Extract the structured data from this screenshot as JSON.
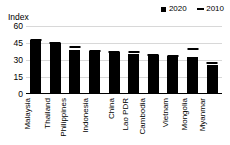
{
  "chart_data": {
    "type": "bar",
    "title": "",
    "subtitle": "",
    "xlabel": "",
    "ylabel": "Index",
    "ylim": [
      0,
      60
    ],
    "yticks": [
      0,
      15,
      30,
      45,
      60
    ],
    "grid": true,
    "legend_position": "top-right",
    "categories": [
      "Malaysia",
      "Thailand",
      "Philippines",
      "Indonesia",
      "China",
      "Lao PDR",
      "Cambodia",
      "Vietnam",
      "Mongolia",
      "Myanmar"
    ],
    "series": [
      {
        "name": "2020",
        "marker": "filled-square",
        "render": "bar",
        "color": "#000000",
        "values": [
          48,
          45,
          38.5,
          38,
          37.5,
          35.5,
          34,
          33.5,
          32.5,
          26
        ]
      },
      {
        "name": "2010",
        "marker": "dash",
        "render": "dash-marker",
        "color": "#000000",
        "values": [
          48,
          45,
          41.5,
          38,
          37.5,
          37,
          34,
          33.5,
          39.5,
          27
        ]
      }
    ]
  },
  "legend": {
    "entries": [
      {
        "label": "2020",
        "marker": "filled-square-icon"
      },
      {
        "label": "2010",
        "marker": "dash-icon"
      }
    ]
  },
  "axis": {
    "y_title": "Index",
    "tick_labels": [
      "60",
      "45",
      "30",
      "15",
      "0"
    ]
  },
  "colors": {
    "series_2020": "#000000",
    "series_2010": "#000000",
    "grid": "#d8d8d8",
    "axis": "#000000",
    "background": "#ffffff"
  }
}
